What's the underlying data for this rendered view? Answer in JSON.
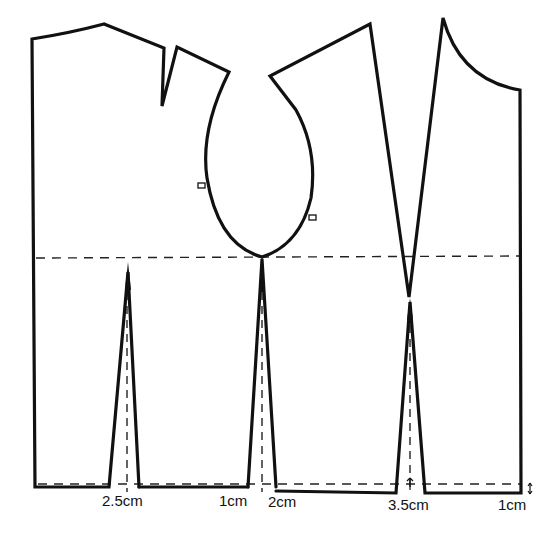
{
  "diagram": {
    "type": "sewing-pattern",
    "stroke_color": "#111111",
    "background_color": "#ffffff"
  },
  "labels": {
    "dart_back": "2.5cm",
    "side_back": "1cm",
    "side_front": "2cm",
    "dart_front": "3.5cm",
    "centre_front_drop": "1cm"
  },
  "guides": {
    "bust_line": "dashed horizontal guide",
    "waist_line": "dashed horizontal guide"
  }
}
